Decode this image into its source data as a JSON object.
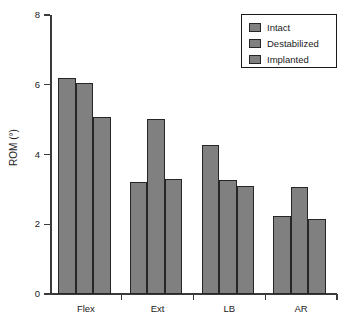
{
  "chart_data": {
    "type": "bar",
    "title": "",
    "subtitle": "",
    "xlabel": "",
    "ylabel": "ROM (°)",
    "categories": [
      "Flex",
      "Ext",
      "LB",
      "AR"
    ],
    "series": [
      {
        "name": "Intact",
        "values": [
          6.2,
          3.22,
          4.28,
          2.25
        ],
        "color": "#808080"
      },
      {
        "name": "Destabilized",
        "values": [
          6.05,
          5.02,
          3.28,
          3.07
        ],
        "color": "#808080"
      },
      {
        "name": "Implanted",
        "values": [
          5.07,
          3.3,
          3.1,
          2.15
        ],
        "color": "#808080"
      }
    ],
    "ylim": [
      0,
      8
    ],
    "yticks": [
      0,
      2,
      4,
      6,
      8
    ],
    "ytick_labels": [
      "0",
      "2",
      "4",
      "6",
      "8"
    ],
    "grid": false,
    "legend_position": "top-right",
    "legend_entries": [
      "Intact",
      "Destabilized",
      "Implanted"
    ],
    "annotations": []
  },
  "axes": {
    "y_title": "ROM (°)",
    "y_tick_labels": [
      "8",
      "6",
      "4",
      "2",
      "0"
    ],
    "x_tick_labels": [
      "Flex",
      "Ext",
      "LB",
      "AR"
    ]
  },
  "legend": {
    "items": [
      {
        "label": "Intact"
      },
      {
        "label": "Destabilized"
      },
      {
        "label": "Implanted"
      }
    ]
  },
  "style": {
    "bar_fill": "#808080",
    "bar_stroke": "#262626",
    "axis_color": "#3a3a3a",
    "background": "#ffffff",
    "text_color": "#1a1a1a"
  }
}
